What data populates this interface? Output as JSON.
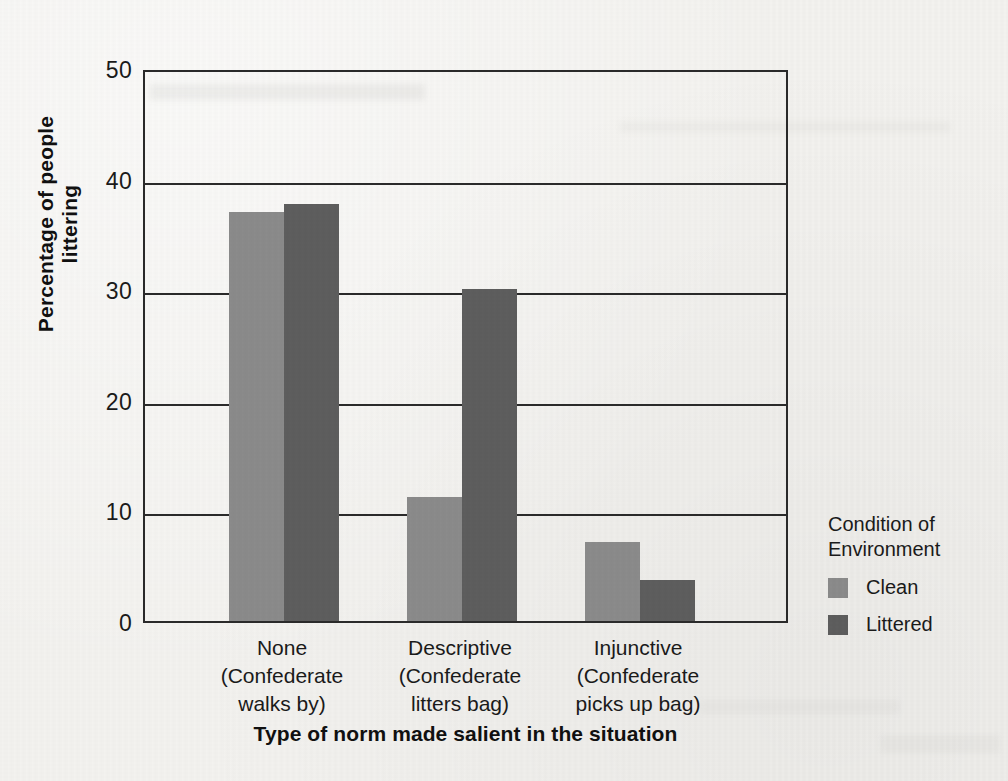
{
  "chart_data": {
    "type": "bar",
    "title": "",
    "xlabel": "Type of norm made salient in the situation",
    "ylabel": "Percentage of people littering",
    "ylim": [
      0,
      50
    ],
    "yticks": [
      0,
      10,
      20,
      30,
      40,
      50
    ],
    "grid": true,
    "legend_position": "right",
    "legend_title": "Condition of Environment",
    "categories": [
      "None (Confederate walks by)",
      "Descriptive (Confederate litters bag)",
      "Injunctive (Confederate picks up bag)"
    ],
    "category_lines": [
      [
        "None",
        "(Confederate",
        "walks by)"
      ],
      [
        "Descriptive",
        "(Confederate",
        "litters bag)"
      ],
      [
        "Injunctive",
        "(Confederate",
        "picks up bag)"
      ]
    ],
    "series": [
      {
        "name": "Clean",
        "color": "#8b8b8b",
        "values": [
          37.0,
          11.2,
          7.1
        ]
      },
      {
        "name": "Littered",
        "color": "#5e5e5e",
        "values": [
          37.7,
          30.0,
          3.7
        ]
      }
    ]
  },
  "axes": {
    "y_tick_labels": [
      "50",
      "40",
      "30",
      "20",
      "10",
      "0"
    ],
    "y_title": "Percentage of people littering",
    "x_title": "Type of norm made salient in the situation"
  },
  "legend": {
    "title_line1": "Condition of",
    "title_line2": "Environment",
    "items": [
      {
        "label": "Clean",
        "color": "#8b8b8b"
      },
      {
        "label": "Littered",
        "color": "#5e5e5e"
      }
    ]
  },
  "colors": {
    "page_background": "#f3f2ef",
    "axis": "#2b2b2b",
    "text": "#1b1b1b",
    "clean": "#8b8b8b",
    "littered": "#5e5e5e"
  }
}
